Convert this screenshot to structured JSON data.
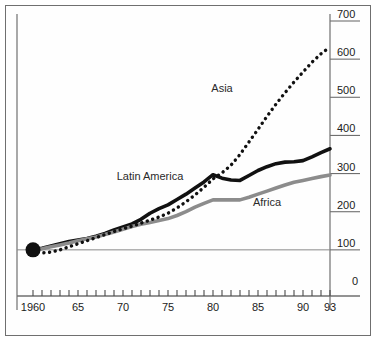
{
  "chart_data": {
    "type": "line",
    "title": "",
    "subtitle": "",
    "xlabel": "",
    "ylabel": "",
    "xlim": [
      1960,
      1993
    ],
    "ylim": [
      0,
      700
    ],
    "grid": false,
    "legend_position": "inline-annotations",
    "y_ticks": [
      0,
      100,
      200,
      300,
      400,
      500,
      600,
      700
    ],
    "y_tick_labels": [
      "0",
      "100",
      "200",
      "300",
      "400",
      "500",
      "600",
      "700"
    ],
    "x_ticks": [
      1960,
      1961,
      1962,
      1963,
      1964,
      1965,
      1966,
      1967,
      1968,
      1969,
      1970,
      1971,
      1972,
      1973,
      1974,
      1975,
      1976,
      1977,
      1978,
      1979,
      1980,
      1981,
      1982,
      1983,
      1984,
      1985,
      1986,
      1987,
      1988,
      1989,
      1990,
      1991,
      1992,
      1993
    ],
    "x_tick_labels": [
      {
        "year": 1960,
        "label": "1960"
      },
      {
        "year": 1965,
        "label": "65"
      },
      {
        "year": 1970,
        "label": "70"
      },
      {
        "year": 1975,
        "label": "75"
      },
      {
        "year": 1980,
        "label": "80"
      },
      {
        "year": 1985,
        "label": "85"
      },
      {
        "year": 1990,
        "label": "90"
      },
      {
        "year": 1993,
        "label": "93"
      }
    ],
    "reference_line": {
      "value": 100,
      "color": "#8a8a8a"
    },
    "origin_marker": {
      "year": 1960,
      "value": 100,
      "shape": "circle",
      "color": "#101010"
    },
    "x": [
      1960,
      1961,
      1962,
      1963,
      1964,
      1965,
      1966,
      1967,
      1968,
      1969,
      1970,
      1971,
      1972,
      1973,
      1974,
      1975,
      1976,
      1977,
      1978,
      1979,
      1980,
      1981,
      1982,
      1983,
      1984,
      1985,
      1986,
      1987,
      1988,
      1989,
      1990,
      1991,
      1992,
      1993
    ],
    "series": [
      {
        "name": "Latin America",
        "style": "solid",
        "color": "#111111",
        "width": 3.6,
        "label_x": 1973,
        "label_y": 290,
        "values": [
          100,
          104,
          110,
          116,
          122,
          126,
          130,
          136,
          143,
          152,
          160,
          168,
          180,
          196,
          208,
          218,
          232,
          246,
          262,
          278,
          297,
          288,
          283,
          282,
          295,
          308,
          318,
          326,
          330,
          331,
          334,
          344,
          355,
          365
        ]
      },
      {
        "name": "Africa",
        "style": "solid",
        "color": "#8c8c8c",
        "width": 3.6,
        "label_x": 1986,
        "label_y": 222,
        "values": [
          100,
          103,
          108,
          113,
          118,
          124,
          129,
          134,
          140,
          147,
          154,
          161,
          167,
          172,
          177,
          182,
          190,
          200,
          212,
          222,
          231,
          231,
          231,
          231,
          238,
          246,
          254,
          262,
          270,
          277,
          282,
          287,
          292,
          296
        ]
      },
      {
        "name": "Asia",
        "style": "dotted",
        "color": "#101010",
        "width": 3.4,
        "label_x": 1981,
        "label_y": 521,
        "values": [
          100,
          92,
          94,
          100,
          108,
          116,
          124,
          132,
          140,
          148,
          155,
          162,
          170,
          178,
          186,
          196,
          210,
          226,
          244,
          264,
          286,
          302,
          322,
          350,
          383,
          416,
          450,
          482,
          512,
          540,
          566,
          592,
          614,
          632
        ]
      }
    ]
  }
}
